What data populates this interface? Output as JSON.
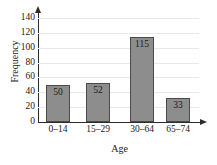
{
  "chart_data": {
    "type": "bar",
    "title": "",
    "categories": [
      "0–14",
      "15–29",
      "30–64",
      "65–74"
    ],
    "values": [
      50,
      52,
      115,
      33
    ],
    "value_labels": [
      "50",
      "52",
      "115",
      "33"
    ],
    "xlabel": "Age",
    "ylabel": "Frequency",
    "ylim": [
      0,
      140
    ],
    "yticks": [
      0,
      20,
      40,
      60,
      80,
      100,
      120,
      140
    ],
    "ytick_labels": [
      "0",
      "20",
      "40",
      "60",
      "80",
      "100",
      "120",
      "140"
    ],
    "grid": true,
    "legend": false,
    "bar_color": "#8d8d8d",
    "bar_border_color": "#4a4a4a",
    "axis_color": "#2b2b2b",
    "grid_color": "#e9e9e9",
    "background": "#ffffff"
  }
}
